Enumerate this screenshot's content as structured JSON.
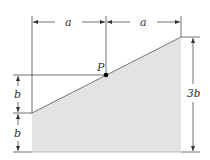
{
  "diagram": {
    "labels": {
      "top_left_width": "a",
      "top_right_width": "a",
      "point": "P",
      "left_upper_height": "b",
      "left_lower_height": "b",
      "right_height": "3b"
    },
    "colors": {
      "fill": "#e3e3e3",
      "line": "#333333",
      "point": "#000000"
    }
  }
}
